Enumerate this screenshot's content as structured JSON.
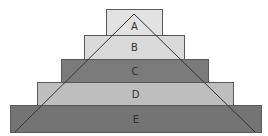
{
  "diagram": {
    "type": "stacked-pyramid",
    "layers": [
      {
        "label": "A",
        "color": "#e2e2e2",
        "x": 106,
        "y": 9,
        "w": 57,
        "h": 27
      },
      {
        "label": "B",
        "color": "#dadada",
        "x": 84,
        "y": 35,
        "w": 101,
        "h": 25
      },
      {
        "label": "C",
        "color": "#7b7b7b",
        "x": 61,
        "y": 59,
        "w": 148,
        "h": 24
      },
      {
        "label": "D",
        "color": "#bebebe",
        "x": 37,
        "y": 82,
        "w": 197,
        "h": 24
      },
      {
        "label": "E",
        "color": "#747474",
        "x": 10,
        "y": 105,
        "w": 252,
        "h": 28
      }
    ],
    "triangle": {
      "apex": [
        134,
        14
      ],
      "left": [
        15,
        132
      ],
      "right": [
        255,
        132
      ],
      "stroke": "#333333"
    }
  }
}
